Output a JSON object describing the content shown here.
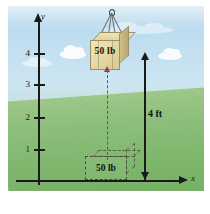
{
  "figure": {
    "sky_color": "#c3e0f0",
    "ground_color": "#8fc07d"
  },
  "axes": {
    "y_label": "y",
    "x_label": "x",
    "y_ticks": [
      {
        "label": "4",
        "top": 53
      },
      {
        "label": "3",
        "top": 84
      },
      {
        "label": "2",
        "top": 117
      },
      {
        "label": "1",
        "top": 149
      }
    ]
  },
  "crate": {
    "weight_label": "50 lb",
    "hook_name": "crane-hook"
  },
  "ghost_crate": {
    "weight_label": "50 lb"
  },
  "dimension": {
    "height_label": "4 ft"
  },
  "watermark": {
    "text": ""
  }
}
